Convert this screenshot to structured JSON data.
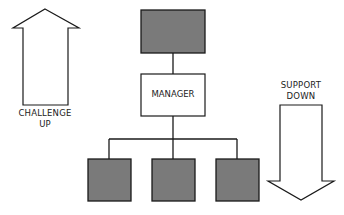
{
  "diagram": {
    "type": "org-hierarchy",
    "nodes": {
      "top": {
        "label": "",
        "fill": "#7a7a7a"
      },
      "manager": {
        "label": "MANAGER",
        "fill": "#ffffff"
      },
      "subordinates": [
        {
          "label": "",
          "fill": "#7a7a7a"
        },
        {
          "label": "",
          "fill": "#7a7a7a"
        },
        {
          "label": "",
          "fill": "#7a7a7a"
        }
      ]
    },
    "arrows": {
      "up": {
        "direction": "up",
        "line1": "CHALLENGE",
        "line2": "UP"
      },
      "down": {
        "direction": "down",
        "line1": "SUPPORT",
        "line2": "DOWN"
      }
    },
    "colors": {
      "stroke": "#1a1a1a",
      "box_fill": "#7a7a7a",
      "background": "#ffffff"
    }
  }
}
